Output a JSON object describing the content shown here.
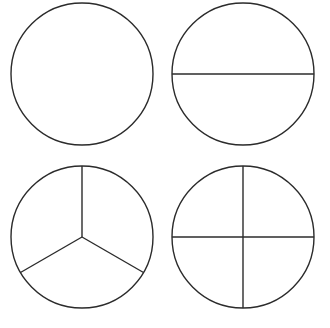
{
  "figure": {
    "background_color": "#ffffff",
    "stroke_color": "#2b2b2b",
    "fill_color": "#ffffff",
    "stroke_width": 1.4,
    "width": 330,
    "height": 328
  },
  "chart_data": {
    "type": "pie",
    "subtitle": "",
    "xlabel": "",
    "ylabel": "",
    "grid": false,
    "legend": "none",
    "layout": "2 by 2 grid of circles",
    "panels": [
      {
        "id": "circle-whole",
        "name": "whole",
        "label": "1 whole",
        "fraction": "1/1",
        "parts": 1,
        "slice_values": [
          1
        ],
        "slice_labels": [
          "1/1"
        ],
        "divider_count": 0,
        "divider_angles_deg": [],
        "center_x": 82,
        "center_y": 74,
        "radius": 71
      },
      {
        "id": "circle-halves",
        "name": "halves",
        "label": "halves",
        "fraction": "1/2",
        "parts": 2,
        "slice_values": [
          0.5,
          0.5
        ],
        "slice_labels": [
          "1/2",
          "1/2"
        ],
        "divider_count": 1,
        "divider_angles_deg": [
          0,
          180
        ],
        "center_x": 243,
        "center_y": 74,
        "radius": 71
      },
      {
        "id": "circle-thirds",
        "name": "thirds",
        "label": "thirds",
        "fraction": "1/3",
        "parts": 3,
        "slice_values": [
          0.3333,
          0.3333,
          0.3333
        ],
        "slice_labels": [
          "1/3",
          "1/3",
          "1/3"
        ],
        "divider_count": 3,
        "divider_angles_deg": [
          90,
          210,
          330
        ],
        "center_x": 82,
        "center_y": 237,
        "radius": 71
      },
      {
        "id": "circle-quarters",
        "name": "quarters",
        "label": "quarters",
        "fraction": "1/4",
        "parts": 4,
        "slice_values": [
          0.25,
          0.25,
          0.25,
          0.25
        ],
        "slice_labels": [
          "1/4",
          "1/4",
          "1/4",
          "1/4"
        ],
        "divider_count": 4,
        "divider_angles_deg": [
          0,
          90,
          180,
          270
        ],
        "center_x": 243,
        "center_y": 237,
        "radius": 71
      }
    ]
  }
}
